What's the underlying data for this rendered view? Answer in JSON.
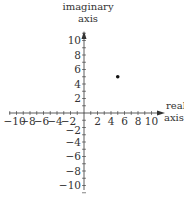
{
  "diagram": {
    "imaginary_axis_label_line1": "imaginary",
    "imaginary_axis_label_line2": "axis",
    "real_axis_label_line1": "real",
    "real_axis_label_line2": "axis",
    "x_ticks": [
      "-10",
      "-8",
      "-6",
      "-4",
      "-2",
      "2",
      "4",
      "6",
      "8",
      "10"
    ],
    "y_ticks": [
      "10",
      "8",
      "6",
      "4",
      "2",
      "-2",
      "-4",
      "-6",
      "-8",
      "-10"
    ],
    "point": {
      "x": 5,
      "y": 5
    },
    "colors": {
      "axis": "#333333",
      "point": "#111111",
      "background": "#ffffff"
    }
  },
  "chart_data": {
    "type": "scatter",
    "title": "",
    "xlabel": "real axis",
    "ylabel": "imaginary axis",
    "xlim": [
      -11,
      11
    ],
    "ylim": [
      -11,
      11
    ],
    "x_tick_labels": [
      -10,
      -8,
      -6,
      -4,
      -2,
      2,
      4,
      6,
      8,
      10
    ],
    "y_tick_labels": [
      10,
      8,
      6,
      4,
      2,
      -2,
      -4,
      -6,
      -8,
      -10
    ],
    "minor_tick_step": 1,
    "grid": false,
    "series": [
      {
        "name": "point",
        "x": [
          5
        ],
        "y": [
          5
        ]
      }
    ]
  }
}
